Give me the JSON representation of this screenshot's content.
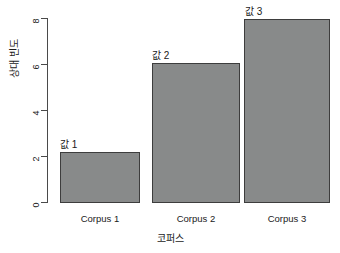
{
  "chart_data": {
    "type": "bar",
    "title": "",
    "xlabel": "코퍼스",
    "ylabel": "상대 빈도",
    "categories": [
      "Corpus 1",
      "Corpus 2",
      "Corpus 3"
    ],
    "values": [
      2.2,
      6.1,
      8.0
    ],
    "point_labels": [
      "값 1",
      "값 2",
      "값 3"
    ],
    "ylim": [
      0,
      8
    ],
    "yticks": [
      0,
      2,
      4,
      6,
      8
    ],
    "ytick_labels": [
      "0",
      "2",
      "4",
      "6",
      "8"
    ],
    "grid": false,
    "legend": false,
    "bar_color": "#888a8a",
    "bar_border_color": "#3d3d3d",
    "axis_color": "#4a4a4a",
    "background": "#ffffff"
  }
}
